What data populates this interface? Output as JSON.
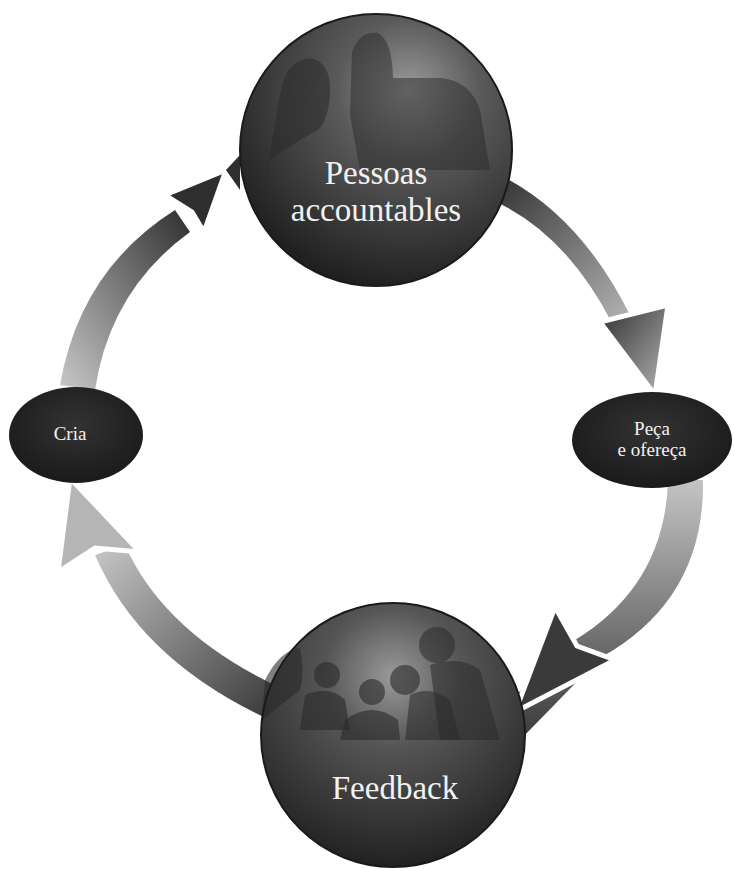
{
  "diagram": {
    "type": "cycle",
    "nodes": [
      {
        "id": "top",
        "shape": "sphere",
        "label_line1": "Pessoas",
        "label_line2": "accountables"
      },
      {
        "id": "right",
        "shape": "ellipse",
        "label_line1": "Peça",
        "label_line2": "e ofereça"
      },
      {
        "id": "bottom",
        "shape": "sphere",
        "label_line1": "Feedback"
      },
      {
        "id": "left",
        "shape": "ellipse",
        "label_line1": "Cria"
      }
    ],
    "edges": [
      {
        "from": "top",
        "to": "right"
      },
      {
        "from": "right",
        "to": "bottom"
      },
      {
        "from": "bottom",
        "to": "left"
      },
      {
        "from": "left",
        "to": "top"
      }
    ],
    "colors": {
      "background": "#ffffff",
      "node_dark": "#2a2a2a",
      "sphere_highlight": "#8a8a8a",
      "arrow_dark": "#3a3a3a",
      "arrow_light": "#bdbdbd",
      "label_text": "#f2f2f2"
    }
  }
}
